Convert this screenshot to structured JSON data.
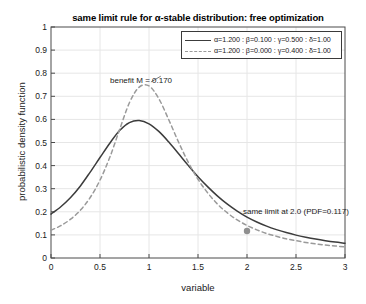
{
  "chart_data": {
    "type": "line",
    "title": "same limit rule for α-stable distribution: free optimization",
    "xlabel": "variable",
    "ylabel": "probabilistic density function",
    "xlim": [
      0,
      3
    ],
    "ylim": [
      0,
      1
    ],
    "xticks": [
      "0",
      "0.5",
      "1",
      "1.5",
      "2",
      "2.5",
      "3"
    ],
    "xtick_values": [
      0,
      0.5,
      1,
      1.5,
      2,
      2.5,
      3
    ],
    "yticks": [
      "0",
      "0.1",
      "0.2",
      "0.3",
      "0.4",
      "0.5",
      "0.6",
      "0.7",
      "0.8",
      "0.9",
      "1"
    ],
    "ytick_values": [
      0,
      0.1,
      0.2,
      0.3,
      0.4,
      0.5,
      0.6,
      0.7,
      0.8,
      0.9,
      1
    ],
    "grid": true,
    "legend_position": "top-right",
    "series": [
      {
        "name": "α=1.200 : β=0.100 : γ=0.500 : δ=1.00",
        "style": "solid",
        "color": "#3c3c3c",
        "x": [
          0.0,
          0.1,
          0.2,
          0.3,
          0.4,
          0.5,
          0.6,
          0.7,
          0.8,
          0.9,
          1.0,
          1.1,
          1.2,
          1.3,
          1.4,
          1.5,
          1.6,
          1.7,
          1.8,
          1.9,
          2.0,
          2.1,
          2.2,
          2.3,
          2.4,
          2.5,
          2.6,
          2.7,
          2.8,
          2.9,
          3.0
        ],
        "y": [
          0.19,
          0.222,
          0.262,
          0.312,
          0.372,
          0.435,
          0.497,
          0.552,
          0.586,
          0.595,
          0.581,
          0.548,
          0.503,
          0.452,
          0.401,
          0.352,
          0.308,
          0.268,
          0.233,
          0.203,
          0.177,
          0.156,
          0.138,
          0.123,
          0.11,
          0.099,
          0.09,
          0.082,
          0.075,
          0.069,
          0.064
        ]
      },
      {
        "name": "α=1.200 : β=0.000 : γ=0.400 : δ=1.00",
        "style": "dashed",
        "color": "#9a9a9a",
        "x": [
          0.0,
          0.1,
          0.2,
          0.3,
          0.4,
          0.5,
          0.6,
          0.7,
          0.8,
          0.9,
          1.0,
          1.1,
          1.2,
          1.3,
          1.4,
          1.5,
          1.6,
          1.7,
          1.8,
          1.9,
          2.0,
          2.1,
          2.2,
          2.3,
          2.4,
          2.5,
          2.6,
          2.7,
          2.8,
          2.9,
          3.0
        ],
        "y": [
          0.12,
          0.14,
          0.168,
          0.207,
          0.262,
          0.337,
          0.436,
          0.556,
          0.672,
          0.74,
          0.745,
          0.69,
          0.6,
          0.503,
          0.415,
          0.341,
          0.281,
          0.233,
          0.195,
          0.165,
          0.141,
          0.122,
          0.106,
          0.094,
          0.083,
          0.075,
          0.067,
          0.061,
          0.056,
          0.052,
          0.048
        ]
      }
    ],
    "markers": [
      {
        "name": "same-limit-point",
        "x": 2.0,
        "y": 0.117,
        "color": "#8f8f8f"
      }
    ],
    "annotations": [
      {
        "name": "benefit-annotation",
        "text": "benefit M = 0.170",
        "x": 1.1,
        "y": 0.775
      },
      {
        "name": "same-limit-annotation",
        "text": "same limit at 2.0 (PDF=0.117)",
        "x": 1.95,
        "y": 0.155
      }
    ]
  },
  "colors": {
    "solid_series": "#3c3c3c",
    "dashed_series": "#9a9a9a",
    "marker": "#8f8f8f",
    "grid": "#e6e6e6",
    "axis": "#4a4a4a",
    "background": "#ffffff"
  }
}
